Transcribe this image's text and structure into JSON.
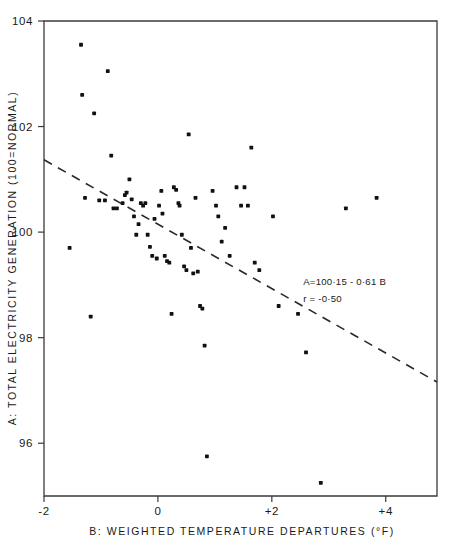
{
  "chart_data": {
    "type": "scatter",
    "title": "",
    "xlabel": "B: WEIGHTED TEMPERATURE DEPARTURES (°F)",
    "ylabel": "A: TOTAL ELECTRICITY GENERATION  (100=NORMAL)",
    "xlim": [
      -2,
      4.9
    ],
    "ylim": [
      95.0,
      104
    ],
    "grid": false,
    "legend": null,
    "xticks": [
      -2,
      0,
      2,
      4
    ],
    "xticklabels": [
      "-2",
      "0",
      "+2",
      "+4"
    ],
    "yticks": [
      96,
      98,
      100,
      102,
      104
    ],
    "yticklabels": [
      "96",
      "98",
      "100",
      "102",
      "104"
    ],
    "marker": "filled-square-dot",
    "point_color": "#111111",
    "annotations": [
      {
        "id": "fit-equation",
        "text": "A=100·15 - 0·61 B",
        "x": 2.55,
        "y": 99.0
      },
      {
        "id": "fit-correlation",
        "text": "r = -0·50",
        "x": 2.55,
        "y": 98.67
      }
    ],
    "fit": {
      "style": "dashed",
      "label": "least-squares regression line",
      "intercept": 100.15,
      "slope": -0.61,
      "r": -0.5,
      "x_start": -2.0,
      "y_start": 101.37,
      "x_end": 4.9,
      "y_end": 97.16
    },
    "points": [
      [
        -1.55,
        99.7
      ],
      [
        -1.35,
        103.55
      ],
      [
        -1.33,
        102.6
      ],
      [
        -1.28,
        100.65
      ],
      [
        -1.18,
        98.4
      ],
      [
        -1.12,
        102.25
      ],
      [
        -1.03,
        100.6
      ],
      [
        -0.93,
        100.6
      ],
      [
        -0.88,
        103.05
      ],
      [
        -0.82,
        101.45
      ],
      [
        -0.78,
        100.45
      ],
      [
        -0.72,
        100.45
      ],
      [
        -0.62,
        100.55
      ],
      [
        -0.58,
        100.7
      ],
      [
        -0.55,
        100.75
      ],
      [
        -0.5,
        101.0
      ],
      [
        -0.46,
        100.62
      ],
      [
        -0.42,
        100.3
      ],
      [
        -0.38,
        99.95
      ],
      [
        -0.34,
        100.15
      ],
      [
        -0.3,
        100.55
      ],
      [
        -0.26,
        100.5
      ],
      [
        -0.22,
        100.55
      ],
      [
        -0.18,
        99.95
      ],
      [
        -0.14,
        99.72
      ],
      [
        -0.1,
        99.55
      ],
      [
        -0.06,
        100.25
      ],
      [
        -0.02,
        99.5
      ],
      [
        0.02,
        100.5
      ],
      [
        0.06,
        100.78
      ],
      [
        0.08,
        100.35
      ],
      [
        0.12,
        99.55
      ],
      [
        0.16,
        99.45
      ],
      [
        0.2,
        99.42
      ],
      [
        0.24,
        98.45
      ],
      [
        0.28,
        100.85
      ],
      [
        0.32,
        100.8
      ],
      [
        0.36,
        100.55
      ],
      [
        0.38,
        100.5
      ],
      [
        0.42,
        99.95
      ],
      [
        0.46,
        99.35
      ],
      [
        0.5,
        99.28
      ],
      [
        0.54,
        101.85
      ],
      [
        0.58,
        99.7
      ],
      [
        0.62,
        99.22
      ],
      [
        0.66,
        100.65
      ],
      [
        0.7,
        99.25
      ],
      [
        0.74,
        98.6
      ],
      [
        0.78,
        98.55
      ],
      [
        0.82,
        97.85
      ],
      [
        0.86,
        95.75
      ],
      [
        0.96,
        100.78
      ],
      [
        1.02,
        100.5
      ],
      [
        1.06,
        100.3
      ],
      [
        1.12,
        99.82
      ],
      [
        1.18,
        100.08
      ],
      [
        1.26,
        99.55
      ],
      [
        1.38,
        100.85
      ],
      [
        1.46,
        100.5
      ],
      [
        1.52,
        100.85
      ],
      [
        1.58,
        100.5
      ],
      [
        1.64,
        101.6
      ],
      [
        1.7,
        99.42
      ],
      [
        1.78,
        99.28
      ],
      [
        2.02,
        100.3
      ],
      [
        2.12,
        98.6
      ],
      [
        2.46,
        98.45
      ],
      [
        2.6,
        97.72
      ],
      [
        2.86,
        95.25
      ],
      [
        3.3,
        100.45
      ],
      [
        3.84,
        100.65
      ]
    ]
  },
  "axes": {
    "y_axis_label": "A: TOTAL ELECTRICITY GENERATION  (100=NORMAL)",
    "x_axis_label": "B: WEIGHTED TEMPERATURE DEPARTURES (°F)"
  }
}
